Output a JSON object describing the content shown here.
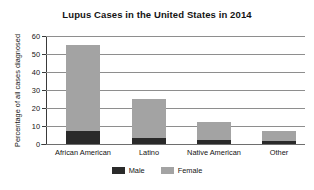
{
  "chart_data": {
    "type": "bar",
    "subtype": "stacked-vertical",
    "title": "Lupus Cases in the United States in 2014",
    "xlabel": "",
    "ylabel": "Percentage of all cases diagnosed",
    "categories": [
      "African American",
      "Latino",
      "Native American",
      "Other"
    ],
    "series": [
      {
        "name": "Male",
        "values": [
          7,
          3.5,
          2.5,
          1.5
        ],
        "color": "#2a2a2a"
      },
      {
        "name": "Female",
        "values": [
          48,
          21.5,
          9.5,
          5.5
        ],
        "color": "#a3a3a3"
      }
    ],
    "totals": [
      55,
      25,
      12,
      7
    ],
    "ylim": [
      0,
      60
    ],
    "yticks": [
      0,
      10,
      20,
      30,
      40,
      50,
      60
    ],
    "ytick_labels": [
      "0",
      "10",
      "20",
      "30",
      "40",
      "50",
      "60"
    ],
    "grid": "horizontal",
    "legend_position": "bottom-center"
  },
  "legend": {
    "items": [
      {
        "label": "Male",
        "color": "#2a2a2a"
      },
      {
        "label": "Female",
        "color": "#a3a3a3"
      }
    ]
  }
}
